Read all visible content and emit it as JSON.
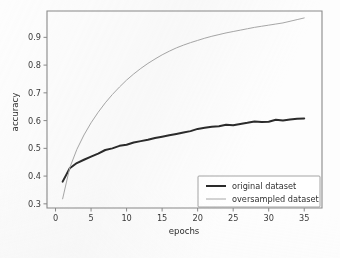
{
  "chart_data": {
    "type": "line",
    "title": "",
    "xlabel": "epochs",
    "ylabel": "accuracy",
    "xlim": [
      -1.2,
      37.5
    ],
    "ylim": [
      0.285,
      0.995
    ],
    "xticks": [
      0,
      5,
      10,
      15,
      20,
      25,
      30,
      35
    ],
    "xtick_labels": [
      "0",
      "5",
      "10",
      "15",
      "20",
      "25",
      "30",
      "35"
    ],
    "yticks": [
      0.3,
      0.4,
      0.5,
      0.6,
      0.7,
      0.8,
      0.9
    ],
    "ytick_labels": [
      "0.3",
      "0.4",
      "0.5",
      "0.6",
      "0.7",
      "0.8",
      "0.9"
    ],
    "grid": false,
    "legend_position": "lower right",
    "x": [
      1,
      2,
      3,
      4,
      5,
      6,
      7,
      8,
      9,
      10,
      11,
      12,
      13,
      14,
      15,
      16,
      17,
      18,
      19,
      20,
      21,
      22,
      23,
      24,
      25,
      26,
      27,
      28,
      29,
      30,
      31,
      32,
      33,
      34,
      35
    ],
    "series": [
      {
        "name": "original dataset",
        "color": "#2b2b2b",
        "linewidth": 2.0,
        "values": [
          0.38,
          0.428,
          0.447,
          0.459,
          0.47,
          0.481,
          0.494,
          0.5,
          0.509,
          0.513,
          0.521,
          0.526,
          0.531,
          0.537,
          0.542,
          0.547,
          0.552,
          0.557,
          0.562,
          0.57,
          0.574,
          0.578,
          0.58,
          0.585,
          0.583,
          0.588,
          0.592,
          0.597,
          0.595,
          0.596,
          0.603,
          0.6,
          0.604,
          0.607,
          0.608
        ]
      },
      {
        "name": "oversampled dataset",
        "color": "#a8a8a8",
        "linewidth": 1.0,
        "values": [
          0.318,
          0.43,
          0.496,
          0.548,
          0.592,
          0.63,
          0.664,
          0.694,
          0.721,
          0.746,
          0.768,
          0.788,
          0.806,
          0.822,
          0.837,
          0.85,
          0.862,
          0.872,
          0.881,
          0.889,
          0.897,
          0.904,
          0.91,
          0.916,
          0.921,
          0.926,
          0.931,
          0.936,
          0.94,
          0.944,
          0.948,
          0.952,
          0.958,
          0.964,
          0.97
        ]
      }
    ]
  },
  "legend": {
    "entries": [
      {
        "label": "original dataset"
      },
      {
        "label": "oversampled dataset"
      }
    ]
  },
  "axes": {
    "x_title": "epochs",
    "y_title": "accuracy"
  }
}
